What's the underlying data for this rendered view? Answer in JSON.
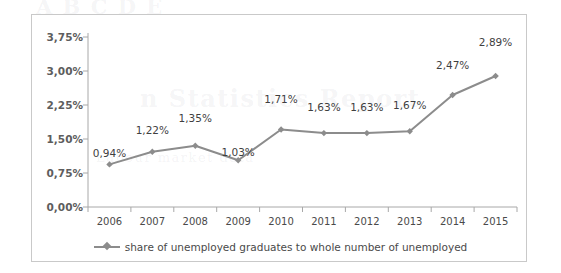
{
  "chart_data": {
    "type": "line",
    "title": "",
    "subtitle": "",
    "xlabel": "",
    "ylabel": "",
    "categories": [
      "2006",
      "2007",
      "2008",
      "2009",
      "2010",
      "2011",
      "2012",
      "2013",
      "2014",
      "2015"
    ],
    "values": [
      0.94,
      1.22,
      1.35,
      1.03,
      1.71,
      1.63,
      1.63,
      1.67,
      2.47,
      2.89
    ],
    "data_labels": [
      "0,94%",
      "1,22%",
      "1,35%",
      "1,03%",
      "1,71%",
      "1,63%",
      "1,63%",
      "1,67%",
      "2,47%",
      "2,89%"
    ],
    "series": [
      {
        "name": "share of unemployed graduates to whole number of unemployed",
        "values": [
          0.94,
          1.22,
          1.35,
          1.03,
          1.71,
          1.63,
          1.63,
          1.67,
          2.47,
          2.89
        ],
        "color": "#8c8c8c",
        "marker": "diamond"
      }
    ],
    "ylim": [
      0,
      3.75
    ],
    "ytick_values": [
      0,
      0.75,
      1.5,
      2.25,
      3.0,
      3.75
    ],
    "ytick_labels": [
      "0,00%",
      "0,75%",
      "1,50%",
      "2,25%",
      "3,00%",
      "3,75%"
    ],
    "grid": false,
    "legend_position": "bottom",
    "legend_entries": [
      "share of unemployed graduates to whole number of unemployed"
    ],
    "decimal_separator": ","
  },
  "legend": {
    "label": "share of unemployed graduates to whole number of unemployed"
  },
  "colors": {
    "series": "#8c8c8c",
    "axis": "#a8a8a8",
    "frame": "#c9c9c9",
    "tick_label": "#4a4a4a",
    "y_tick_label": "#5d5d5d",
    "data_label": "#3f3f3f"
  },
  "page_bleed": {
    "line1": "A  B  C  D  E",
    "line2": "n  Statistics  Report",
    "line3": "Labour market data"
  }
}
